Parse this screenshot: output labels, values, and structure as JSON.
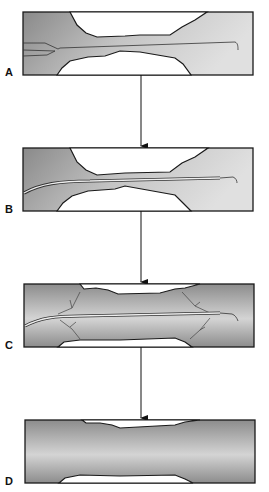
{
  "figure": {
    "panels": [
      {
        "id": "A",
        "label": "A"
      },
      {
        "id": "B",
        "label": "B"
      },
      {
        "id": "C",
        "label": "C"
      },
      {
        "id": "D",
        "label": "D"
      }
    ],
    "colors": {
      "vessel_dark": "#8e8e8e",
      "vessel_light": "#e2e2e2",
      "outline": "#1a1a1a",
      "background": "#ffffff"
    }
  }
}
